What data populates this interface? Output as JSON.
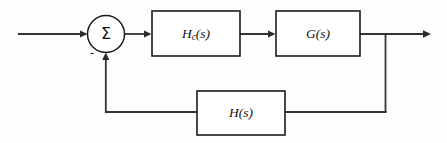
{
  "diagram": {
    "canvas": {
      "width": 447,
      "height": 143
    },
    "colors": {
      "background": "#fdfdfd",
      "line": "#333333",
      "block_stroke": "#1b1b1b",
      "block_fill": "#ffffff",
      "text": "#111111"
    },
    "summing_junction": {
      "symbol": "Σ",
      "negative_sign": "-",
      "center_x": 106,
      "center_y": 34,
      "radius": 18.5
    },
    "blocks": [
      {
        "id": "controller",
        "label_main": "H",
        "label_sub": "c",
        "label_arg": "(s)",
        "label_text": "Hc(s)",
        "x": 152,
        "y": 11,
        "width": 88,
        "height": 45
      },
      {
        "id": "plant",
        "label_main": "G",
        "label_sub": "",
        "label_arg": "(s)",
        "label_text": "G(s)",
        "x": 276,
        "y": 11,
        "width": 84,
        "height": 45
      },
      {
        "id": "feedback",
        "label_main": "H",
        "label_sub": "",
        "label_arg": "(s)",
        "label_text": "H(s)",
        "x": 197,
        "y": 91,
        "width": 88,
        "height": 44
      }
    ],
    "signals": [
      {
        "id": "input",
        "from": "external-input",
        "to": "summing-junction",
        "has_arrow": true
      },
      {
        "id": "error",
        "from": "summing-junction",
        "to": "controller",
        "has_arrow": true
      },
      {
        "id": "control",
        "from": "controller",
        "to": "plant",
        "has_arrow": true
      },
      {
        "id": "output",
        "from": "plant",
        "to": "external-output",
        "has_arrow": true
      },
      {
        "id": "feedback-tap",
        "from": "output-junction",
        "to": "feedback-block",
        "has_arrow": false
      },
      {
        "id": "feedback-return",
        "from": "feedback-block",
        "to": "summing-junction",
        "has_arrow": true
      }
    ]
  }
}
